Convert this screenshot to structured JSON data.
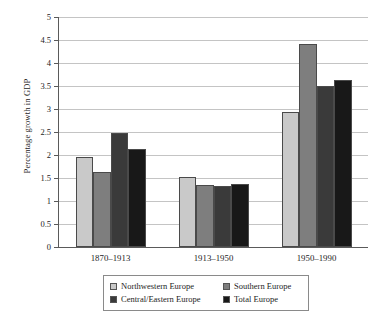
{
  "chart_data": {
    "type": "bar",
    "title": "",
    "subtitle": "",
    "xlabel": "",
    "ylabel": "Percentage growth in GDP",
    "categories": [
      "1870–1913",
      "1913–1950",
      "1950–1990"
    ],
    "series": [
      {
        "name": "Northwestern Europe",
        "color": "#c9c9c9",
        "values": [
          1.95,
          1.52,
          2.93
        ]
      },
      {
        "name": "Southern Europe",
        "color": "#7e7e7e",
        "values": [
          1.63,
          1.35,
          4.41
        ]
      },
      {
        "name": "Central/Eastern Europe",
        "color": "#3a3a3a",
        "values": [
          2.47,
          1.33,
          3.5
        ]
      },
      {
        "name": "Total Europe",
        "color": "#181818",
        "values": [
          2.13,
          1.38,
          3.62
        ]
      }
    ],
    "ylim": [
      0,
      5
    ],
    "yticks": [
      0,
      0.5,
      1,
      1.5,
      2,
      2.5,
      3,
      3.5,
      4,
      4.5,
      5
    ],
    "ytick_labels": [
      "0",
      "0.5",
      "1",
      "1.5",
      "2",
      "2.5",
      "3",
      "3.5",
      "4",
      "4.5",
      "5"
    ],
    "grid": "horizontal",
    "legend_position": "bottom",
    "legend_layout": "2x2-boxed"
  },
  "legend": {
    "entries": [
      {
        "label": "Northwestern Europe",
        "color": "#c9c9c9"
      },
      {
        "label": "Southern Europe",
        "color": "#7e7e7e"
      },
      {
        "label": "Central/Eastern Europe",
        "color": "#3a3a3a"
      },
      {
        "label": "Total Europe",
        "color": "#181818"
      }
    ]
  },
  "axes": {
    "y_title": "Percentage growth in GDP"
  }
}
